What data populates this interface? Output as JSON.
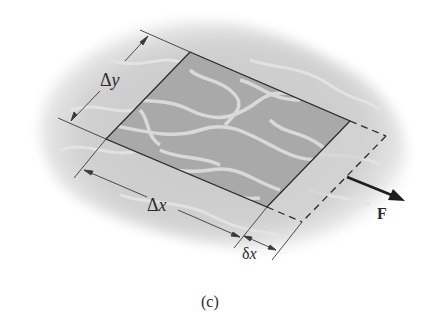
{
  "figure": {
    "caption": "(c)",
    "labels": {
      "delta_y": "Δy",
      "delta_x": "Δx",
      "small_delta_x": "δx",
      "force": "F"
    }
  },
  "geometry": {
    "element": {
      "top_left": [
        190,
        52
      ],
      "top_right": [
        350,
        121
      ],
      "bottom_right": [
        267,
        207
      ],
      "bottom_left": [
        106,
        139
      ]
    },
    "displaced_edge": {
      "top": [
        386,
        136
      ],
      "bottom": [
        302,
        222
      ]
    },
    "force_arrow": {
      "from": [
        347,
        177
      ],
      "to": [
        404,
        200
      ]
    }
  },
  "colors": {
    "element_fill": "#a9a9a9",
    "vein": "#d9d9d9",
    "blob": "#cfcfcf",
    "line": "#2a2a2a"
  }
}
